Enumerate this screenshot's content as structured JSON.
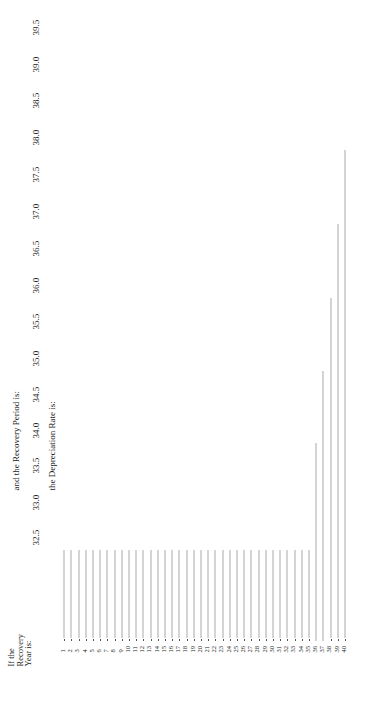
{
  "header": {
    "row_label": [
      "If the",
      "Recovery",
      "Year is:"
    ],
    "period_label": "and the Recovery Period is:",
    "rate_label": "the Depreciation Rate is:"
  },
  "columns": [
    "32.5",
    "33.0",
    "33.5",
    "34.0",
    "34.5",
    "35.0",
    "35.5",
    "36.0",
    "36.5",
    "37.0",
    "37.5",
    "38.0",
    "38.5",
    "39.0",
    "39.5"
  ],
  "years": [
    "1",
    "2",
    "3",
    "4",
    "5",
    "6",
    "7",
    "8",
    "9",
    "10",
    "11",
    "12",
    "13",
    "14",
    "15",
    "16",
    "17",
    "18",
    "19",
    "20",
    "21",
    "22",
    "23",
    "24",
    "25",
    "26",
    "27",
    "28",
    "29",
    "30",
    "31",
    "32",
    "33",
    "34",
    "35",
    "36",
    "37",
    "38",
    "39",
    "40"
  ],
  "rates": {
    "32.5": [
      "1.538",
      "3.077",
      "3.077",
      "3.077",
      "3.077",
      "3.077",
      "3.077",
      "3.077",
      "3.077",
      "3.077",
      "3.077",
      "3.077",
      "3.077",
      "3.077",
      "3.077",
      "3.077",
      "3.077",
      "3.077",
      "3.077",
      "3.077",
      "3.077",
      "3.077",
      "3.077",
      "3.077",
      "3.077",
      "3.077",
      "3.077",
      "3.077",
      "3.077",
      "3.077",
      "3.076",
      "3.077",
      "3.076",
      "3.077",
      "3.076"
    ],
    "33.0": [
      "1.515",
      "3.030",
      "3.030",
      "3.030",
      "3.030",
      "3.030",
      "3.030",
      "3.030",
      "3.030",
      "3.030",
      "3.030",
      "3.030",
      "3.030",
      "3.031",
      "3.030",
      "3.031",
      "3.030",
      "3.031",
      "3.030",
      "3.031",
      "3.030",
      "3.031",
      "3.030",
      "3.031",
      "3.030",
      "3.031",
      "3.030",
      "3.031",
      "3.030",
      "3.031",
      "3.030",
      "3.031",
      "3.030",
      "3.031",
      "1.515"
    ],
    "33.5": [
      "1.493",
      "2.985",
      "2.985",
      "2.985",
      "2.985",
      "2.985",
      "2.985",
      "2.985",
      "2.985",
      "2.985",
      "2.985",
      "2.985",
      "2.985",
      "2.985",
      "2.985",
      "2.985",
      "2.985",
      "2.985",
      "2.985",
      "2.985",
      "2.985",
      "2.985",
      "2.985",
      "2.985",
      "2.985",
      "2.985",
      "2.985",
      "2.985",
      "2.985",
      "2.985",
      "2.985",
      "2.986",
      "2.985",
      "2.986",
      "2.985"
    ],
    "34.0": [
      "1.471",
      "2.941",
      "2.941",
      "2.941",
      "2.941",
      "2.941",
      "2.941",
      "2.941",
      "2.941",
      "2.941",
      "2.941",
      "2.941",
      "2.941",
      "2.941",
      "2.941",
      "2.941",
      "2.941",
      "2.941",
      "2.941",
      "2.941",
      "2.941",
      "2.941",
      "2.941",
      "2.942",
      "2.941",
      "2.942",
      "2.941",
      "2.942",
      "2.941",
      "2.942",
      "2.941",
      "2.942",
      "2.941",
      "2.942",
      "2.941",
      "1.471"
    ],
    "34.5": [
      "1.449",
      "2.899",
      "2.899",
      "2.899",
      "2.899",
      "2.899",
      "2.899",
      "2.898",
      "2.899",
      "2.898",
      "2.899",
      "2.898",
      "2.899",
      "2.898",
      "2.899",
      "2.898",
      "2.899",
      "2.898",
      "2.899",
      "2.898",
      "2.899",
      "2.898",
      "2.899",
      "2.898",
      "2.899",
      "2.898",
      "2.899",
      "2.898",
      "2.899",
      "2.898",
      "2.899",
      "2.898",
      "2.899",
      "2.898",
      "2.899",
      "2.899"
    ],
    "35.0": [
      "1.429",
      "2.857",
      "2.857",
      "2.857",
      "2.857",
      "2.857",
      "2.857",
      "2.857",
      "2.857",
      "2.857",
      "2.857",
      "2.857",
      "2.857",
      "2.857",
      "2.857",
      "2.857",
      "2.857",
      "2.857",
      "2.857",
      "2.857",
      "2.857",
      "2.857",
      "2.857",
      "2.857",
      "2.858",
      "2.857",
      "2.858",
      "2.857",
      "2.858",
      "2.857",
      "2.858",
      "2.857",
      "2.858",
      "2.857",
      "2.858",
      "2.857",
      "1.429"
    ],
    "35.5": [
      "1.408",
      "2.817",
      "2.817",
      "2.817",
      "2.817",
      "2.817",
      "2.817",
      "2.817",
      "2.817",
      "2.817",
      "2.817",
      "2.817",
      "2.817",
      "2.817",
      "2.817",
      "2.817",
      "2.817",
      "2.817",
      "2.817",
      "2.817",
      "2.817",
      "2.817",
      "2.817",
      "2.817",
      "2.817",
      "2.817",
      "2.817",
      "2.817",
      "2.817",
      "2.816",
      "2.817",
      "2.816",
      "2.817",
      "2.816",
      "2.817",
      "2.816",
      "2.817"
    ],
    "36.0": [
      "1.389",
      "2.778",
      "2.778",
      "2.778",
      "2.778",
      "2.778",
      "2.778",
      "2.778",
      "2.778",
      "2.778",
      "2.778",
      "2.778",
      "2.778",
      "2.778",
      "2.778",
      "2.778",
      "2.778",
      "2.778",
      "2.778",
      "2.778",
      "2.778",
      "2.777",
      "2.778",
      "2.777",
      "2.778",
      "2.777",
      "2.778",
      "2.777",
      "2.778",
      "2.777",
      "2.778",
      "2.777",
      "2.778",
      "2.777",
      "2.778",
      "2.777",
      "2.778",
      "1.389"
    ],
    "36.5": [
      "1.370",
      "2.740",
      "2.740",
      "2.740",
      "2.740",
      "2.740",
      "2.740",
      "2.740",
      "2.740",
      "2.740",
      "2.740",
      "2.740",
      "2.740",
      "2.740",
      "2.740",
      "2.740",
      "2.739",
      "2.740",
      "2.739",
      "2.740",
      "2.739",
      "2.740",
      "2.739",
      "2.740",
      "2.739",
      "2.740",
      "2.739",
      "2.740",
      "2.739",
      "2.740",
      "2.739",
      "2.740",
      "2.739",
      "2.740",
      "2.739",
      "2.740",
      "2.739",
      "2.740"
    ],
    "37.0": [
      "1.351",
      "2.703",
      "2.703",
      "2.703",
      "2.703",
      "2.703",
      "2.703",
      "2.703",
      "2.703",
      "2.703",
      "2.703",
      "2.703",
      "2.703",
      "2.703",
      "2.703",
      "2.703",
      "2.703",
      "2.702",
      "2.703",
      "2.702",
      "2.703",
      "2.702",
      "2.703",
      "2.702",
      "2.703",
      "2.702",
      "2.703",
      "2.702",
      "2.703",
      "2.702",
      "2.703",
      "2.702",
      "2.703",
      "2.702",
      "2.703",
      "2.702",
      "2.703",
      "2.702",
      "1.351"
    ],
    "37.5": [
      "1.333",
      "2.667",
      "2.667",
      "2.667",
      "2.667",
      "2.667",
      "2.667",
      "2.667",
      "2.667",
      "2.667",
      "2.667",
      "2.667",
      "2.667",
      "2.667",
      "2.667",
      "2.666",
      "2.667",
      "2.666",
      "2.667",
      "2.666",
      "2.667",
      "2.666",
      "2.667",
      "2.666",
      "2.667",
      "2.666",
      "2.667",
      "2.666",
      "2.667",
      "2.666",
      "2.667",
      "2.666",
      "2.667",
      "2.666",
      "2.667",
      "2.666",
      "2.667",
      "2.666",
      "2.667"
    ],
    "38.0": [
      "1.316",
      "2.632",
      "2.632",
      "2.632",
      "2.632",
      "2.632",
      "2.632",
      "2.631",
      "2.632",
      "2.631",
      "2.632",
      "2.631",
      "2.632",
      "2.631",
      "2.632",
      "2.631",
      "2.632",
      "2.631",
      "2.632",
      "2.631",
      "2.632",
      "2.631",
      "2.632",
      "2.631",
      "2.632",
      "2.631",
      "2.632",
      "2.631",
      "2.632",
      "2.631",
      "2.632",
      "2.631",
      "2.632",
      "2.631",
      "2.632",
      "2.631",
      "2.632",
      "2.631",
      "2.632",
      "1.316"
    ],
    "38.5": [
      "1.299",
      "2.597",
      "2.597",
      "2.597",
      "2.597",
      "2.597",
      "2.597",
      "2.597",
      "2.597",
      "2.598",
      "2.597",
      "2.598",
      "2.597",
      "2.598",
      "2.597",
      "2.598",
      "2.597",
      "2.598",
      "2.597",
      "2.598",
      "2.597",
      "2.598",
      "2.597",
      "2.598",
      "2.597",
      "2.598",
      "2.597",
      "2.598",
      "2.597",
      "2.598",
      "2.597",
      "2.598",
      "2.597",
      "2.598",
      "2.597",
      "2.598",
      "2.597",
      "2.598",
      "2.597",
      "2.598"
    ],
    "39.0": [
      "1.282",
      "2.564",
      "2.564",
      "2.564",
      "2.564",
      "2.564",
      "2.564",
      "2.564",
      "2.564",
      "2.564",
      "2.564",
      "2.564",
      "2.564",
      "2.564",
      "2.564",
      "2.564",
      "2.564",
      "2.564",
      "2.564",
      "2.564",
      "2.564",
      "2.564",
      "2.564",
      "2.564",
      "2.564",
      "2.564",
      "2.564",
      "2.564",
      "2.564",
      "2.564",
      "2.564",
      "2.565",
      "2.564",
      "2.565",
      "2.564",
      "2.565",
      "2.564",
      "2.565",
      "2.564",
      "1.282"
    ],
    "39.5": [
      "1.266",
      "2.532",
      "2.532",
      "2.532",
      "2.532",
      "2.532",
      "2.532",
      "2.532",
      "2.532",
      "2.532",
      "2.532",
      "2.532",
      "2.532",
      "2.531",
      "2.532",
      "2.531",
      "2.532",
      "2.531",
      "2.532",
      "2.531",
      "2.532",
      "2.531",
      "2.532",
      "2.531",
      "2.532",
      "2.531",
      "2.532",
      "2.531",
      "2.532",
      "2.531",
      "2.532",
      "2.531",
      "2.532",
      "2.531",
      "2.532",
      "2.531",
      "2.532",
      "2.531",
      "2.532",
      "2.531"
    ]
  }
}
